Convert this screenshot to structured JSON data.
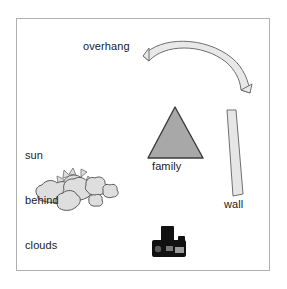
{
  "scene": {
    "title": "photography scene diagram",
    "background_color": "#ffffff",
    "frame_border_color": "#b0b0b0"
  },
  "labels": {
    "overhang": "overhang",
    "family": "family",
    "wall": "wall",
    "sun_behind_clouds": [
      "sun",
      "behind",
      "clouds"
    ]
  },
  "objects": {
    "overhang": {
      "shape": "curved-band-arc",
      "fill": "#e8e8e8",
      "stroke": "#6f6f6f"
    },
    "family": {
      "shape": "triangle",
      "fill": "#a8a8a8",
      "stroke": "#3c3c3c"
    },
    "wall": {
      "shape": "tilted-rectangle",
      "fill": "#e6e6e6",
      "stroke": "#6f6f6f"
    },
    "sun": {
      "shape": "spiked-disc",
      "fill": "#dcdcdc",
      "stroke": "#6f6f6f"
    },
    "clouds": {
      "shape": "puff-cluster",
      "fill": "#dedede",
      "stroke": "#5a5a5a"
    },
    "camera": {
      "shape": "camera-icon",
      "fill": "#111111"
    }
  }
}
